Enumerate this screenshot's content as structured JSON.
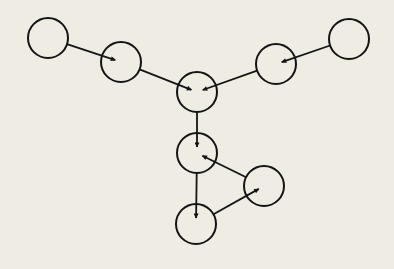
{
  "diagram": {
    "type": "directed-graph",
    "colors": {
      "background": "#efece4",
      "stroke": "#141414"
    },
    "node_radius": 20,
    "nodes": [
      {
        "id": "A",
        "cx": 48,
        "cy": 38
      },
      {
        "id": "B",
        "cx": 121,
        "cy": 62
      },
      {
        "id": "C",
        "cx": 197,
        "cy": 92
      },
      {
        "id": "D",
        "cx": 276,
        "cy": 64
      },
      {
        "id": "E",
        "cx": 349,
        "cy": 39
      },
      {
        "id": "F",
        "cx": 197,
        "cy": 153
      },
      {
        "id": "G",
        "cx": 264,
        "cy": 186
      },
      {
        "id": "H",
        "cx": 196,
        "cy": 224
      }
    ],
    "edges": [
      {
        "from": "A",
        "to": "B"
      },
      {
        "from": "B",
        "to": "C"
      },
      {
        "from": "E",
        "to": "D"
      },
      {
        "from": "D",
        "to": "C"
      },
      {
        "from": "C",
        "to": "F"
      },
      {
        "from": "F",
        "to": "H"
      },
      {
        "from": "H",
        "to": "G"
      },
      {
        "from": "G",
        "to": "F"
      }
    ]
  }
}
